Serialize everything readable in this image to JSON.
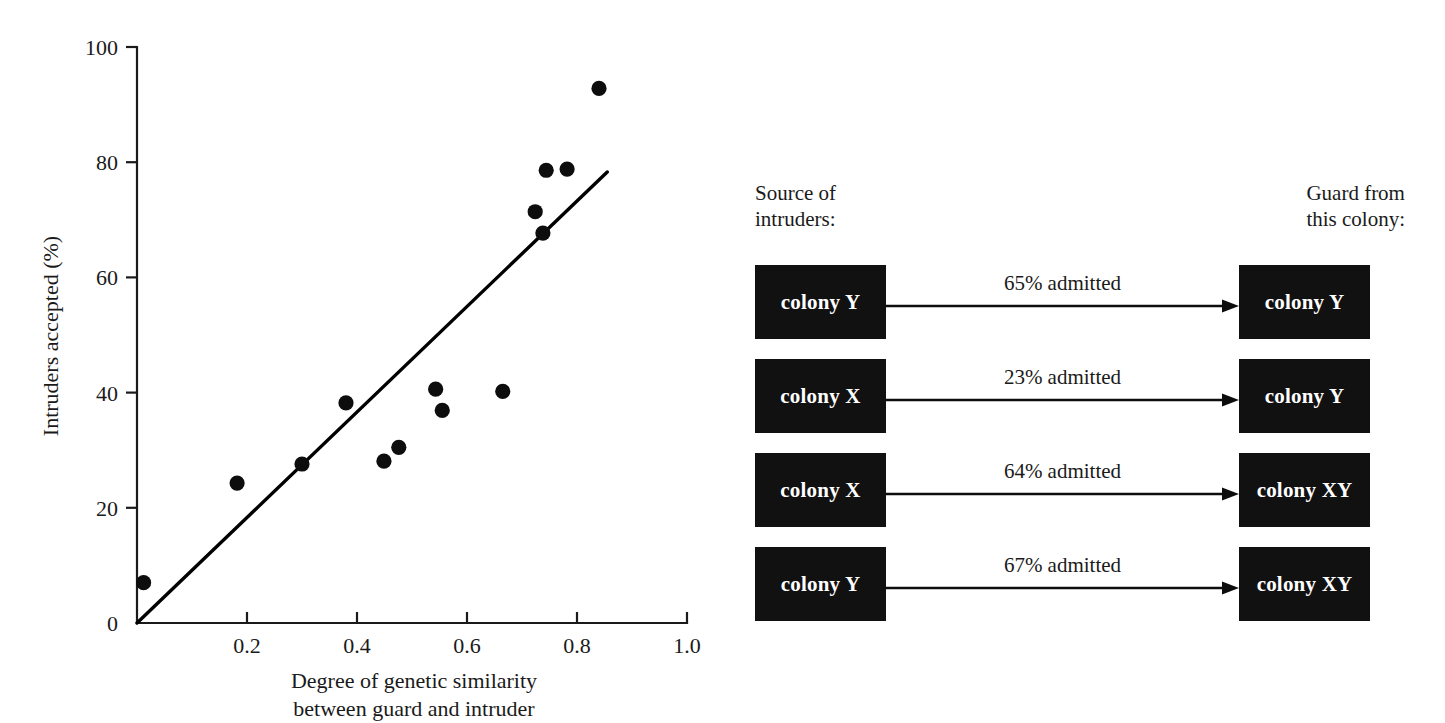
{
  "chart_data": {
    "type": "scatter",
    "title": "",
    "xlabel": "Degree of genetic similarity between guard and intruder",
    "xlabel_line1": "Degree of genetic similarity",
    "xlabel_line2": "between guard and intruder",
    "ylabel": "Intruders accepted (%)",
    "xlim": [
      0,
      1.0
    ],
    "ylim": [
      0,
      100
    ],
    "xticks": [
      "0",
      "0.2",
      "0.4",
      "0.6",
      "0.8",
      "1.0"
    ],
    "xtick_values": [
      0,
      0.2,
      0.4,
      0.6,
      0.8,
      1.0
    ],
    "yticks": [
      "0",
      "20",
      "40",
      "60",
      "80",
      "100"
    ],
    "ytick_values": [
      0,
      20,
      40,
      60,
      80,
      100
    ],
    "grid": false,
    "legend": "none",
    "points": [
      {
        "x": 0.012,
        "y": 7.0
      },
      {
        "x": 0.182,
        "y": 24.3
      },
      {
        "x": 0.3,
        "y": 27.6
      },
      {
        "x": 0.38,
        "y": 38.2
      },
      {
        "x": 0.449,
        "y": 28.1
      },
      {
        "x": 0.476,
        "y": 30.5
      },
      {
        "x": 0.543,
        "y": 40.6
      },
      {
        "x": 0.555,
        "y": 36.9
      },
      {
        "x": 0.665,
        "y": 40.2
      },
      {
        "x": 0.724,
        "y": 71.4
      },
      {
        "x": 0.738,
        "y": 67.7
      },
      {
        "x": 0.744,
        "y": 78.6
      },
      {
        "x": 0.782,
        "y": 78.8
      },
      {
        "x": 0.84,
        "y": 92.8
      }
    ],
    "trendline": {
      "x0": 0.0,
      "y0": 0.0,
      "x1": 0.855,
      "y1": 78.3
    }
  },
  "diagram": {
    "header_left_line1": "Source of",
    "header_left_line2": "intruders:",
    "header_right_line1": "Guard from",
    "header_right_line2": "this colony:",
    "rows": [
      {
        "source": "colony Y",
        "label": "65% admitted",
        "target": "colony Y"
      },
      {
        "source": "colony X",
        "label": "23% admitted",
        "target": "colony Y"
      },
      {
        "source": "colony X",
        "label": "64% admitted",
        "target": "colony XY"
      },
      {
        "source": "colony Y",
        "label": "67% admitted",
        "target": "colony XY"
      }
    ]
  },
  "colors": {
    "ink": "#0d0d0d",
    "box_fill": "#111111",
    "box_text": "#ffffff",
    "page_bg": "#ffffff"
  }
}
